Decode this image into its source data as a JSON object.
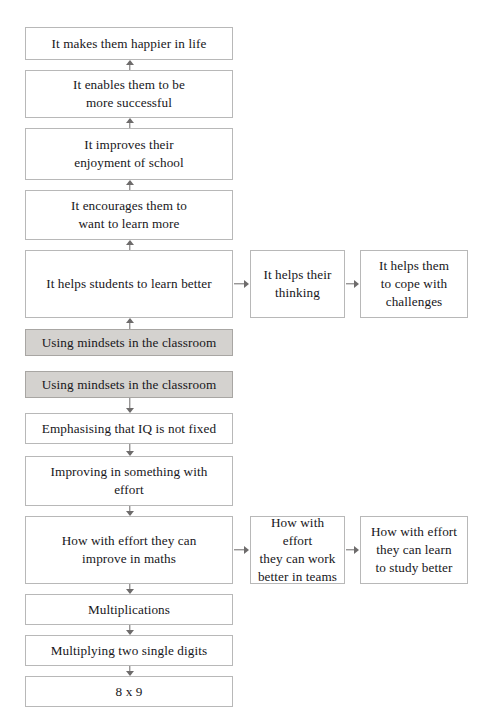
{
  "diagram": {
    "type": "flowchart",
    "orientation": "two-directional vertical ladder with lateral branches",
    "colors": {
      "box_border": "#b8b8b8",
      "box_fill": "#ffffff",
      "highlight_fill": "#d4d2cf",
      "highlight_border": "#a8a6a3",
      "arrow": "#6d6b6b",
      "text": "#17161a"
    },
    "nodes": [
      {
        "id": "n1",
        "label": "It makes them happier in life",
        "column": 1,
        "shaded": false,
        "x": 25,
        "y": 27,
        "w": 208,
        "h": 33
      },
      {
        "id": "n2",
        "label": "It enables them to be\nmore successful",
        "column": 1,
        "shaded": false,
        "x": 25,
        "y": 70,
        "w": 208,
        "h": 48
      },
      {
        "id": "n3",
        "label": "It improves their\nenjoyment of school",
        "column": 1,
        "shaded": false,
        "x": 25,
        "y": 128,
        "w": 208,
        "h": 52
      },
      {
        "id": "n4",
        "label": "It encourages them to\nwant to learn more",
        "column": 1,
        "shaded": false,
        "x": 25,
        "y": 190,
        "w": 208,
        "h": 50
      },
      {
        "id": "n5",
        "label": "It helps students to learn better",
        "column": 1,
        "shaded": false,
        "x": 25,
        "y": 250,
        "w": 208,
        "h": 68
      },
      {
        "id": "n6",
        "label": "It helps their\nthinking",
        "column": 2,
        "shaded": false,
        "x": 250,
        "y": 250,
        "w": 95,
        "h": 68
      },
      {
        "id": "n7",
        "label": "It helps them\nto cope with\nchallenges",
        "column": 3,
        "shaded": false,
        "x": 360,
        "y": 250,
        "w": 108,
        "h": 68
      },
      {
        "id": "n8",
        "label": "Using mindsets in the classroom",
        "column": 1,
        "shaded": true,
        "x": 25,
        "y": 329,
        "w": 208,
        "h": 27
      },
      {
        "id": "n9",
        "label": "Using mindsets in the classroom",
        "column": 1,
        "shaded": true,
        "x": 25,
        "y": 371,
        "w": 208,
        "h": 27
      },
      {
        "id": "n10",
        "label": "Emphasising that IQ is not fixed",
        "column": 1,
        "shaded": false,
        "x": 25,
        "y": 413,
        "w": 208,
        "h": 31
      },
      {
        "id": "n11",
        "label": "Improving in something with\neffort",
        "column": 1,
        "shaded": false,
        "x": 25,
        "y": 456,
        "w": 208,
        "h": 50
      },
      {
        "id": "n12",
        "label": "How with effort they can\nimprove in maths",
        "column": 1,
        "shaded": false,
        "x": 25,
        "y": 516,
        "w": 208,
        "h": 68
      },
      {
        "id": "n13",
        "label": "How with effort\nthey can work\nbetter in teams",
        "column": 2,
        "shaded": false,
        "x": 250,
        "y": 516,
        "w": 95,
        "h": 68
      },
      {
        "id": "n14",
        "label": "How with effort\nthey can learn\nto study better",
        "column": 3,
        "shaded": false,
        "x": 360,
        "y": 516,
        "w": 108,
        "h": 68
      },
      {
        "id": "n15",
        "label": "Multiplications",
        "column": 1,
        "shaded": false,
        "x": 25,
        "y": 594,
        "w": 208,
        "h": 31
      },
      {
        "id": "n16",
        "label": "Multiplying two single digits",
        "column": 1,
        "shaded": false,
        "x": 25,
        "y": 635,
        "w": 208,
        "h": 31
      },
      {
        "id": "n17",
        "label": "8 x 9",
        "column": 1,
        "shaded": false,
        "x": 25,
        "y": 676,
        "w": 208,
        "h": 31
      }
    ],
    "arrows": [
      {
        "id": "a1",
        "direction": "up",
        "from": "n2",
        "to": "n1",
        "x": 124,
        "y": 60,
        "w": 12,
        "h": 10
      },
      {
        "id": "a2",
        "direction": "up",
        "from": "n3",
        "to": "n2",
        "x": 124,
        "y": 118,
        "w": 12,
        "h": 10
      },
      {
        "id": "a3",
        "direction": "up",
        "from": "n4",
        "to": "n3",
        "x": 124,
        "y": 180,
        "w": 12,
        "h": 10
      },
      {
        "id": "a4",
        "direction": "up",
        "from": "n5",
        "to": "n4",
        "x": 124,
        "y": 240,
        "w": 12,
        "h": 10
      },
      {
        "id": "a5",
        "direction": "up",
        "from": "n8",
        "to": "n5",
        "x": 124,
        "y": 318,
        "w": 12,
        "h": 11
      },
      {
        "id": "a6",
        "direction": "right",
        "from": "n5",
        "to": "n6",
        "x": 234,
        "y": 279,
        "w": 15,
        "h": 10
      },
      {
        "id": "a7",
        "direction": "right",
        "from": "n6",
        "to": "n7",
        "x": 346,
        "y": 279,
        "w": 13,
        "h": 10
      },
      {
        "id": "a8",
        "direction": "down",
        "from": "n9",
        "to": "n10",
        "x": 124,
        "y": 398,
        "w": 12,
        "h": 15
      },
      {
        "id": "a9",
        "direction": "down",
        "from": "n10",
        "to": "n11",
        "x": 124,
        "y": 444,
        "w": 12,
        "h": 12
      },
      {
        "id": "a10",
        "direction": "down",
        "from": "n11",
        "to": "n12",
        "x": 124,
        "y": 506,
        "w": 12,
        "h": 10
      },
      {
        "id": "a11",
        "direction": "right",
        "from": "n12",
        "to": "n13",
        "x": 234,
        "y": 545,
        "w": 15,
        "h": 10
      },
      {
        "id": "a12",
        "direction": "right",
        "from": "n13",
        "to": "n14",
        "x": 346,
        "y": 545,
        "w": 13,
        "h": 10
      },
      {
        "id": "a13",
        "direction": "down",
        "from": "n12",
        "to": "n15",
        "x": 124,
        "y": 584,
        "w": 12,
        "h": 10
      },
      {
        "id": "a14",
        "direction": "down",
        "from": "n15",
        "to": "n16",
        "x": 124,
        "y": 625,
        "w": 12,
        "h": 10
      },
      {
        "id": "a15",
        "direction": "down",
        "from": "n16",
        "to": "n17",
        "x": 124,
        "y": 666,
        "w": 12,
        "h": 10
      }
    ]
  }
}
